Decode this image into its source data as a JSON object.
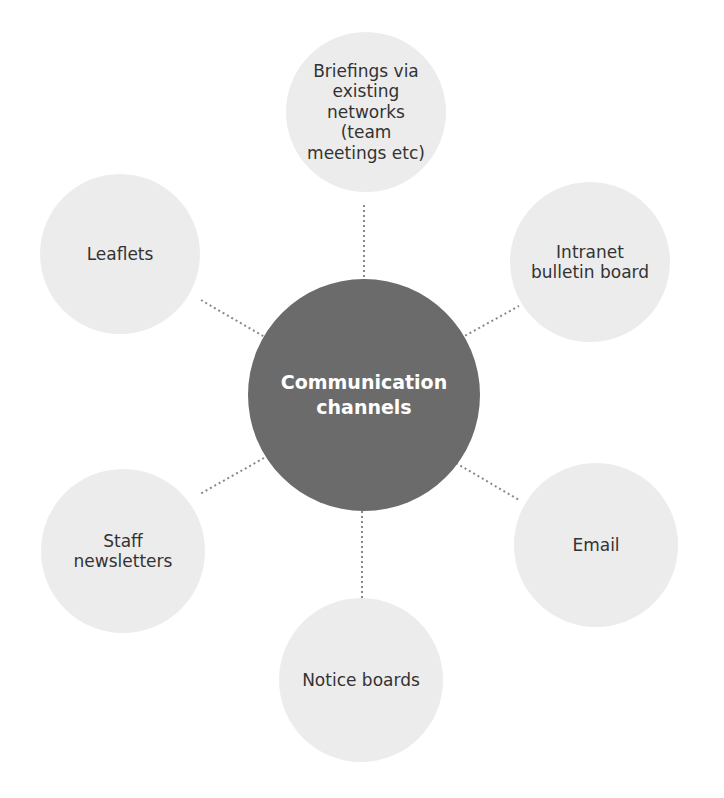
{
  "diagram": {
    "type": "hub-and-spoke",
    "center": {
      "label": "Communication\nchannels",
      "color": "#6b6b6b",
      "text_color": "#ffffff",
      "cx": 364,
      "cy": 395,
      "r": 116
    },
    "satellite_color": "#ececec",
    "connector_color": "#888888",
    "nodes": [
      {
        "label": "Briefings via\nexisting\nnetworks\n(team\nmeetings etc)",
        "cx": 366,
        "cy": 112,
        "r": 80
      },
      {
        "label": "Intranet\nbulletin board",
        "cx": 590,
        "cy": 262,
        "r": 80
      },
      {
        "label": "Email",
        "cx": 596,
        "cy": 545,
        "r": 82
      },
      {
        "label": "Notice boards",
        "cx": 361,
        "cy": 680,
        "r": 82
      },
      {
        "label": "Staff\nnewsletters",
        "cx": 123,
        "cy": 551,
        "r": 82
      },
      {
        "label": "Leaflets",
        "cx": 120,
        "cy": 254,
        "r": 80
      }
    ]
  }
}
